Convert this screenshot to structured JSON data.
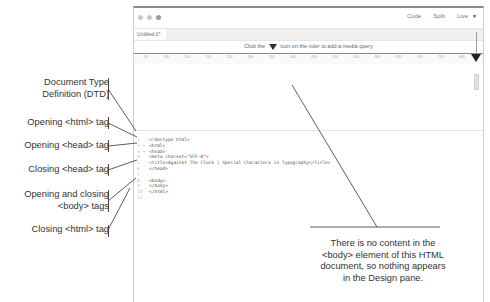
{
  "window": {
    "tab": "Untitled-1*",
    "views": {
      "code": "Code",
      "split": "Split",
      "live": "Live"
    },
    "media_query_hint": {
      "before": "Click the",
      "after": "icon on the ruler to add a media query"
    },
    "ruler_ticks": [
      "50",
      "100",
      "150",
      "200",
      "250",
      "300",
      "350",
      "400",
      "450",
      "500",
      "550",
      "600",
      "650",
      "700",
      "750",
      "800"
    ]
  },
  "code": {
    "line_numbers": [
      "1",
      "2",
      "3",
      "4",
      "5",
      "6",
      "7",
      "8",
      "9",
      "10",
      "11"
    ],
    "fold_markers": [
      "",
      "▾",
      "▾",
      "",
      "",
      "",
      "",
      "",
      "",
      "",
      ""
    ],
    "lines": [
      "<!doctype html>",
      "<html>",
      "<head>",
      "<meta charset=\"UTF-8\">",
      "<title>Against The Clock | Special Characters in Typography</title>",
      "</head>",
      "",
      "<body>",
      "</body>",
      "</html>",
      ""
    ]
  },
  "callouts": [
    {
      "line1": "Document Type",
      "line2": "Definition (DTD)"
    },
    {
      "line1": "Opening <html> tag"
    },
    {
      "line1": "Opening <head> tag"
    },
    {
      "line1": "Closing <head> tag"
    },
    {
      "line1": "Opening and closing",
      "line2": "<body> tags"
    },
    {
      "line1": "Closing <html> tag"
    }
  ],
  "note": {
    "line1": "There is no content in the",
    "line2": "<body> element of this HTML",
    "line3": "document, so nothing appears",
    "line4": "in the Design pane."
  }
}
